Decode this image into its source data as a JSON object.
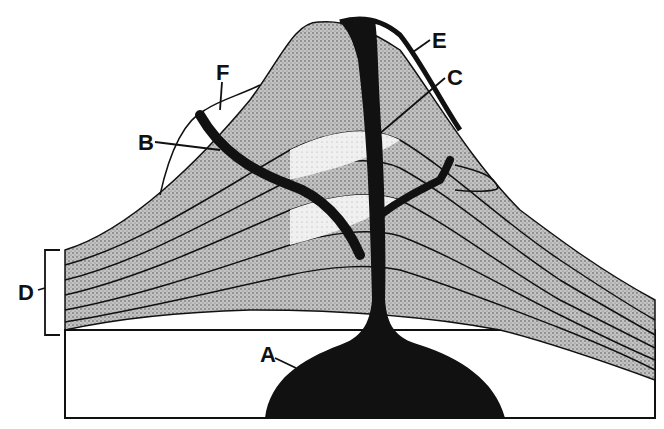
{
  "diagram": {
    "labels": [
      {
        "id": "A",
        "text": "A",
        "x": 260,
        "y": 345,
        "target": "magma chamber"
      },
      {
        "id": "B",
        "text": "B",
        "x": 138,
        "y": 133,
        "target": "side vent / dike"
      },
      {
        "id": "C",
        "text": "C",
        "x": 448,
        "y": 68,
        "target": "central vent"
      },
      {
        "id": "D",
        "text": "D",
        "x": 20,
        "y": 283,
        "target": "rock layers (bracket)"
      },
      {
        "id": "E",
        "text": "E",
        "x": 433,
        "y": 30,
        "target": "lava flow on surface"
      },
      {
        "id": "F",
        "text": "F",
        "x": 217,
        "y": 62,
        "target": "ash/lava layer at flank"
      }
    ],
    "colors": {
      "ink": "#111111",
      "stipple_dark": "#9a9a9a",
      "stipple_light": "#d8d8d8",
      "background": "#ffffff"
    }
  }
}
